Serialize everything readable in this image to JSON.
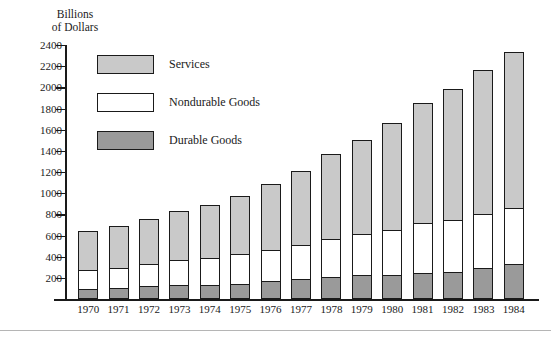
{
  "chart_data": {
    "type": "bar",
    "subtype": "stacked-bar",
    "title": "",
    "ylabel": "Billions\nof Dollars",
    "xlabel": "",
    "ylim": [
      0,
      2400
    ],
    "ytick_step": 200,
    "yticks": [
      0,
      200,
      400,
      600,
      800,
      1000,
      1200,
      1400,
      1600,
      1800,
      2000,
      2200,
      2400
    ],
    "ytick_labels": [
      "",
      "200",
      "400",
      "600",
      "800",
      "1000",
      "1200",
      "1400",
      "1600",
      "1800",
      "2000",
      "2200",
      "2400"
    ],
    "grid": false,
    "legend_position": "upper-left-inside",
    "categories": [
      "1970",
      "1971",
      "1972",
      "1973",
      "1974",
      "1975",
      "1976",
      "1977",
      "1978",
      "1979",
      "1980",
      "1981",
      "1982",
      "1983",
      "1984"
    ],
    "series": [
      {
        "name": "Durable Goods",
        "color": "#9a9a9a",
        "values": [
          85,
          97,
          111,
          124,
          123,
          134,
          158,
          182,
          202,
          214,
          214,
          236,
          245,
          280,
          318
        ]
      },
      {
        "name": "Nondurable Goods",
        "color": "#ffffff",
        "values": [
          180,
          191,
          208,
          235,
          256,
          279,
          299,
          321,
          353,
          393,
          429,
          474,
          493,
          515,
          536
        ]
      },
      {
        "name": "Services",
        "color": "#c9c9c9",
        "values": [
          367,
          392,
          428,
          463,
          495,
          547,
          617,
          697,
          798,
          885,
          1008,
          1133,
          1232,
          1355,
          1466
        ]
      }
    ],
    "totals": [
      632,
      680,
      747,
      822,
      874,
      960,
      1074,
      1200,
      1353,
      1492,
      1651,
      1843,
      1970,
      2150,
      2320
    ],
    "legend": [
      {
        "label": "Services",
        "color": "#c9c9c9"
      },
      {
        "label": "Nondurable Goods",
        "color": "#ffffff"
      },
      {
        "label": "Durable Goods",
        "color": "#9a9a9a"
      }
    ]
  }
}
